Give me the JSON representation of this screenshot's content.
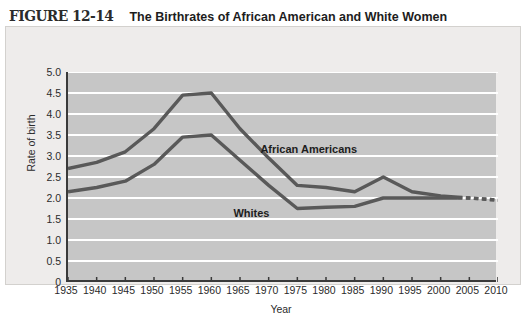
{
  "title": {
    "figure_number": "FIGURE 12-14",
    "text": "The Birthrates of African American and White Women"
  },
  "colors": {
    "line": "#595959",
    "plot_background": "#c6c6c6",
    "panel_background": "#eeeceb",
    "gridline": "#ffffff",
    "axis": "#3a3a3a",
    "text": "#2b2b2b"
  },
  "chart_data": {
    "type": "line",
    "title": "The Birthrates of African American and White Women",
    "xlabel": "Year",
    "ylabel": "Rate of birth",
    "x": [
      1935,
      1940,
      1945,
      1950,
      1955,
      1960,
      1965,
      1970,
      1975,
      1980,
      1985,
      1990,
      1995,
      2000,
      2005,
      2010
    ],
    "xlim": [
      1935,
      2010
    ],
    "ylim": [
      0,
      5.0
    ],
    "yticks": [
      "0",
      "0.5",
      "1.0",
      "1.5",
      "2.0",
      "2.5",
      "3.0",
      "3.5",
      "4.0",
      "4.5",
      "5.0"
    ],
    "ytick_values": [
      0,
      0.5,
      1.0,
      1.5,
      2.0,
      2.5,
      3.0,
      3.5,
      4.0,
      4.5,
      5.0
    ],
    "xticks": [
      "1935",
      "1940",
      "1945",
      "1950",
      "1955",
      "1960",
      "1965",
      "1970",
      "1975",
      "1980",
      "1985",
      "1990",
      "1995",
      "2000",
      "2005",
      "2010"
    ],
    "grid": "horizontal",
    "legend": "inline-annotations",
    "series": [
      {
        "name": "African Americans",
        "label": "African Americans",
        "values": [
          2.7,
          2.85,
          3.1,
          3.65,
          4.45,
          4.5,
          3.65,
          2.95,
          2.3,
          2.25,
          2.15,
          2.5,
          2.15,
          2.05,
          2.0,
          1.95
        ],
        "projected_from": 2003
      },
      {
        "name": "Whites",
        "label": "Whites",
        "values": [
          2.15,
          2.25,
          2.4,
          2.8,
          3.45,
          3.5,
          2.9,
          2.3,
          1.75,
          1.78,
          1.8,
          2.0,
          2.0,
          2.0,
          2.0,
          1.95
        ],
        "projected_from": 2003
      }
    ],
    "annotations": [
      {
        "text": "African Americans",
        "x": 1977,
        "y": 3.15
      },
      {
        "text": "Whites",
        "x": 1967,
        "y": 1.63
      }
    ]
  }
}
